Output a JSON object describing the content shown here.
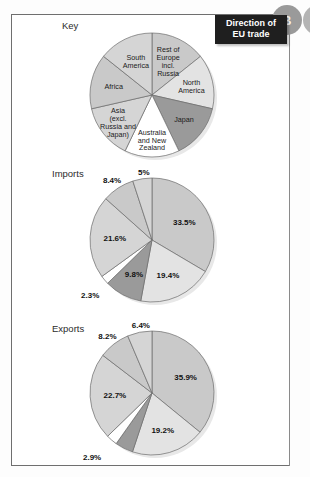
{
  "badges": {
    "current": "B",
    "next": ""
  },
  "caption": {
    "line1": "Direction of",
    "line2": "EU trade"
  },
  "sections": {
    "key_title": "Key",
    "imports_title": "Imports",
    "exports_title": "Exports"
  },
  "colors": {
    "mid_grey": "#c9c9c9",
    "light_grey": "#e3e3e3",
    "dark_grey": "#9a9a9a",
    "white": "#ffffff",
    "pale_grey": "#d5d5d5",
    "outline": "#6b6b6b",
    "caption_bg": "#1f1f1f",
    "badge_bg": "#9a9a9a"
  },
  "chart_data": [
    {
      "type": "pie",
      "title": "Key",
      "legend_position": "inside-slices",
      "categories": [
        "Rest of Europe incl. Russia",
        "North America",
        "Japan",
        "Australia and New Zealand",
        "Asia (excl. Russia and Japan)",
        "Africa",
        "South America"
      ],
      "labels_multiline": [
        [
          "Rest of",
          "Europe",
          "incl.",
          "Russia"
        ],
        [
          "North",
          "America"
        ],
        [
          "Japan"
        ],
        [
          "Australia",
          "and New",
          "Zealand"
        ],
        [
          "Asia",
          "(excl.",
          "Russia and",
          "Japan)"
        ],
        [
          "Africa"
        ],
        [
          "South",
          "America"
        ]
      ],
      "values": [
        14.3,
        14.3,
        14.3,
        14.3,
        14.3,
        14.3,
        14.3
      ],
      "fills": [
        "#c9c9c9",
        "#e3e3e3",
        "#9a9a9a",
        "#ffffff",
        "#d5d5d5",
        "#c9c9c9",
        "#d5d5d5"
      ]
    },
    {
      "type": "pie",
      "title": "Imports",
      "legend_position": "inside-slices",
      "categories": [
        "Rest of Europe incl. Russia",
        "North America",
        "Japan",
        "Australia and New Zealand",
        "Asia (excl. Russia and Japan)",
        "Africa",
        "South America"
      ],
      "values": [
        33.5,
        19.4,
        9.8,
        2.3,
        21.6,
        8.4,
        5.0
      ],
      "value_labels": [
        "33.5%",
        "19.4%",
        "9.8%",
        "2.3%",
        "21.6%",
        "8.4%",
        "5%"
      ],
      "fills": [
        "#c9c9c9",
        "#e3e3e3",
        "#9a9a9a",
        "#ffffff",
        "#d5d5d5",
        "#c9c9c9",
        "#d5d5d5"
      ]
    },
    {
      "type": "pie",
      "title": "Exports",
      "legend_position": "inside-slices",
      "categories": [
        "Rest of Europe incl. Russia",
        "North America",
        "Japan",
        "Australia and New Zealand",
        "Asia (excl. Russia and Japan)",
        "Africa",
        "South America"
      ],
      "values": [
        35.9,
        19.2,
        4.7,
        2.9,
        22.7,
        8.2,
        6.4
      ],
      "value_labels": [
        "35.9%",
        "19.2%",
        "4.7%",
        "2.9%",
        "22.7%",
        "8.2%",
        "6.4%"
      ],
      "fills": [
        "#c9c9c9",
        "#e3e3e3",
        "#9a9a9a",
        "#ffffff",
        "#d5d5d5",
        "#c9c9c9",
        "#d5d5d5"
      ]
    }
  ]
}
